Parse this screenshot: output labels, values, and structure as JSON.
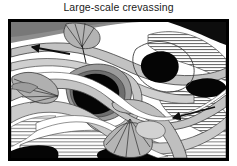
{
  "figure": {
    "title": "Large-scale crevassing",
    "panel_label": "crevasse-pattern-map",
    "colors": {
      "background": "#ffffff",
      "border": "#000000",
      "ice_white": "#ffffff",
      "light_gray": "#c9c9c9",
      "mid_gray": "#a8a8a8",
      "dark_gray": "#8a8a8a",
      "deep_gray": "#707070",
      "black": "#000000",
      "outline": "#3a3a3a",
      "title_text": "#1b1b1b"
    },
    "annotations": [
      {
        "name": "flow-arrow-upper-left",
        "kind": "arrow",
        "direction": "left",
        "x1": 62,
        "y1": 35,
        "x2": 22,
        "y2": 28
      },
      {
        "name": "flow-arrow-lower-right",
        "kind": "arrow",
        "direction": "left",
        "x1": 207,
        "y1": 88,
        "x2": 163,
        "y2": 99
      }
    ],
    "features": [
      {
        "name": "splay-fan-top",
        "kind": "fan",
        "cx": 74,
        "cy": 12
      },
      {
        "name": "splay-fan-left",
        "kind": "fan",
        "cx": 30,
        "cy": 65
      },
      {
        "name": "splay-fan-bottom",
        "kind": "fan",
        "cx": 118,
        "cy": 98
      },
      {
        "name": "crevasse-void-center",
        "kind": "void"
      },
      {
        "name": "crevasse-void-upper-right",
        "kind": "void"
      },
      {
        "name": "crevasse-void-right",
        "kind": "void"
      },
      {
        "name": "crevasse-void-top-right-corner",
        "kind": "void"
      },
      {
        "name": "crevasse-void-bottom-center",
        "kind": "void"
      },
      {
        "name": "hatched-band-upper-right",
        "kind": "hatch"
      },
      {
        "name": "hatched-band-lower-right",
        "kind": "hatch"
      },
      {
        "name": "hatched-band-bottom-left",
        "kind": "hatch"
      },
      {
        "name": "hatched-band-right-edge",
        "kind": "hatch"
      }
    ]
  }
}
